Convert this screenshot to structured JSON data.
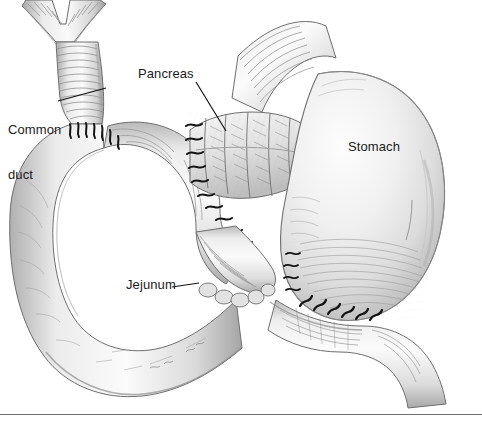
{
  "figure": {
    "background_color": "#ffffff",
    "ink_color": "#1b1b1b",
    "tissue_fill": "#f2f2f2",
    "tissue_shadow": "#9a9a9a",
    "rule_color": "#6f6f6f"
  },
  "labels": [
    {
      "id": "common-duct",
      "lines": [
        "Common",
        "duct"
      ],
      "text": "Common duct",
      "x": 8,
      "y": 92,
      "leader": true
    },
    {
      "id": "pancreas",
      "lines": [
        "Pancreas"
      ],
      "text": "Pancreas",
      "x": 138,
      "y": 66,
      "leader": true
    },
    {
      "id": "stomach",
      "lines": [
        "Stomach"
      ],
      "text": "Stomach",
      "x": 348,
      "y": 139,
      "leader": false
    },
    {
      "id": "jejunum",
      "lines": [
        "Jejunum"
      ],
      "text": "Jejunum",
      "x": 126,
      "y": 277,
      "leader": true
    }
  ],
  "label_text": {
    "common_duct_line1": "Common",
    "common_duct_line2": "duct",
    "pancreas": "Pancreas",
    "stomach": "Stomach",
    "jejunum": "Jejunum"
  },
  "leaders": [
    {
      "id": "common-duct-leader",
      "from": [
        58,
        101
      ],
      "to": [
        106,
        88
      ]
    },
    {
      "id": "pancreas-leader",
      "from": [
        196,
        82
      ],
      "to": [
        226,
        131
      ]
    },
    {
      "id": "jejunum-leader",
      "from": [
        172,
        287
      ],
      "to": [
        199,
        283
      ]
    }
  ],
  "rule": {
    "id": "bottom-rule",
    "y": 414,
    "x1": 0,
    "x2": 482
  },
  "structures": [
    {
      "name": "hepatic-duct-bifurcation",
      "region": "top-left"
    },
    {
      "name": "common-bile-duct",
      "region": "upper-left"
    },
    {
      "name": "duodenal-jejunal-loop",
      "region": "left"
    },
    {
      "name": "pancreas-remnant",
      "region": "center"
    },
    {
      "name": "esophagus",
      "region": "upper-center"
    },
    {
      "name": "stomach",
      "region": "right"
    },
    {
      "name": "efferent-jejunal-limb",
      "region": "bottom-right"
    },
    {
      "name": "hepaticojejunostomy-sutures",
      "region": "upper-left"
    },
    {
      "name": "pancreaticojejunostomy-sutures",
      "region": "center"
    },
    {
      "name": "gastrojejunostomy-sutures",
      "region": "lower-center"
    }
  ]
}
